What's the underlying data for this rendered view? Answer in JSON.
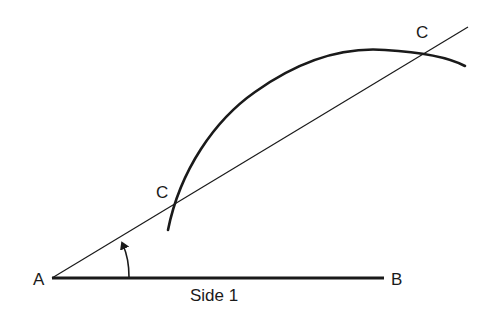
{
  "diagram": {
    "type": "geometric-construction",
    "colors": {
      "line": "#1a1a1a",
      "background": "#ffffff"
    },
    "points": {
      "A": {
        "label": "A",
        "x": 52,
        "y": 278
      },
      "B": {
        "label": "B",
        "x": 384,
        "y": 278
      },
      "C_lower": {
        "label": "C",
        "x": 173,
        "y": 210
      },
      "C_upper": {
        "label": "C",
        "x": 425,
        "y": 47
      }
    },
    "labels": {
      "A": "A",
      "B": "B",
      "C_lower": "C",
      "C_upper": "C",
      "side": "Side 1"
    },
    "elements": [
      {
        "name": "side-1-segment",
        "from": "A",
        "to": "B",
        "weight": "thick"
      },
      {
        "name": "ray-from-A",
        "from": "A",
        "direction": "up-right",
        "weight": "thin"
      },
      {
        "name": "construction-arc",
        "weight": "thick"
      },
      {
        "name": "angle-arrow",
        "at": "A"
      }
    ]
  }
}
